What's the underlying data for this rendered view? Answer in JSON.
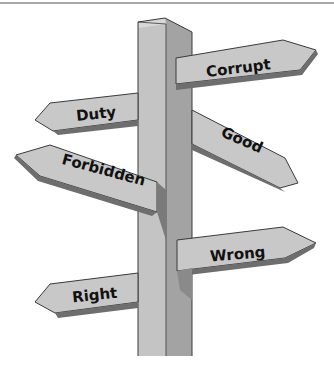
{
  "figure": {
    "colors": {
      "post_front": "#c4c4c4",
      "post_side": "#9d9d9d",
      "post_top": "#d6d6d6",
      "sign_face": "#c8c8c8",
      "sign_edge": "#6e6e6e",
      "outline": "#3a3a3a",
      "text": "#111111"
    },
    "signs": [
      {
        "label": "Corrupt",
        "direction": "right"
      },
      {
        "label": "Duty",
        "direction": "left"
      },
      {
        "label": "Good",
        "direction": "right"
      },
      {
        "label": "Forbidden",
        "direction": "left"
      },
      {
        "label": "Wrong",
        "direction": "right"
      },
      {
        "label": "Right",
        "direction": "left"
      }
    ]
  }
}
